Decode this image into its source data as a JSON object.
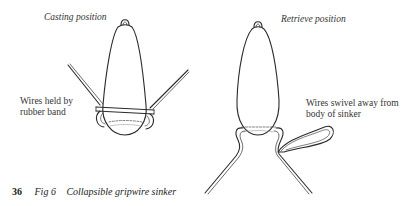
{
  "figure": {
    "page_number": "36",
    "figure_number": "Fig 6",
    "title": "Collapsible gripwire sinker",
    "panels": [
      {
        "heading": "Casting position",
        "annotation_lines": [
          "Wires held by",
          "rubber band"
        ]
      },
      {
        "heading": "Retrieve position",
        "annotation_lines": [
          "Wires swivel away from",
          "body of sinker"
        ]
      }
    ]
  },
  "colors": {
    "ink": "#2a2a2a",
    "background": "#ffffff"
  }
}
